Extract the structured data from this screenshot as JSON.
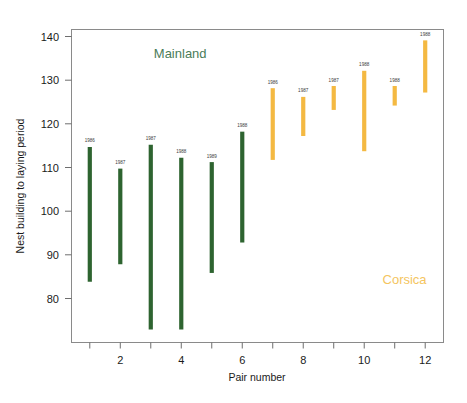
{
  "chart_data": {
    "type": "bar",
    "subtype": "floating-range-bar",
    "title": "",
    "xlabel": "Pair number",
    "ylabel": "Nest building to laying period",
    "xlim": [
      0.4,
      12.6
    ],
    "ylim": [
      71,
      143
    ],
    "grid": false,
    "legend_position": "in-plot annotations",
    "x_ticks_major": [
      2,
      4,
      6,
      8,
      10,
      12
    ],
    "x_ticks_minor": [
      1,
      3,
      5,
      7,
      9,
      11
    ],
    "y_ticks": [
      80,
      90,
      100,
      110,
      120,
      130,
      140
    ],
    "categories": [
      1,
      2,
      3,
      4,
      5,
      6,
      7,
      8,
      9,
      10,
      11,
      12
    ],
    "series": [
      {
        "name": "Mainland",
        "color": "#2e6430",
        "pairs": [
          1,
          2,
          3,
          4,
          5,
          6
        ],
        "low": [
          85,
          89,
          74,
          74,
          87,
          94
        ],
        "high": [
          116,
          111,
          116.5,
          113.5,
          112.5,
          119.5
        ],
        "year_labels": [
          "1986",
          "1987",
          "1987",
          "1988",
          "1989",
          "1988"
        ]
      },
      {
        "name": "Corsica",
        "color": "#f4b942",
        "pairs": [
          7,
          8,
          9,
          10,
          11,
          12
        ],
        "low": [
          113,
          118.5,
          124.5,
          115,
          125.5,
          128.5
        ],
        "high": [
          129.5,
          127.5,
          130,
          133.5,
          130,
          140.5
        ],
        "year_labels": [
          "1986",
          "1987",
          "1987",
          "1988",
          "1988",
          "1988"
        ]
      }
    ],
    "annotations": [
      {
        "text": "Mainland",
        "color": "#4a7c59",
        "x": 3.1,
        "y": 136.5
      },
      {
        "text": "Corsica",
        "color": "#f4c55e",
        "x": 10.6,
        "y": 84.5
      }
    ]
  },
  "axes": {
    "y_title": "Nest building to laying period",
    "x_title": "Pair number",
    "y_tick_labels": [
      "140",
      "130",
      "120",
      "110",
      "100",
      "90",
      "80"
    ],
    "x_tick_labels": [
      "2",
      "4",
      "6",
      "8",
      "10",
      "12"
    ]
  },
  "annotations": {
    "mainland_label": "Mainland",
    "corsica_label": "Corsica"
  },
  "colors": {
    "mainland": "#2e6430",
    "corsica": "#f4b942",
    "mainland_text": "#4a7c59",
    "corsica_text": "#f4c55e",
    "axis": "#6e6e6e",
    "text": "#1a1a1a",
    "background": "#ffffff"
  }
}
